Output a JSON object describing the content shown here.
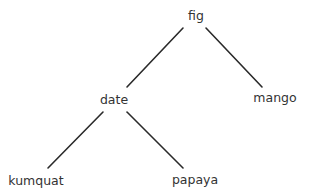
{
  "diagram": {
    "type": "tree",
    "nodes": {
      "root": {
        "label": "fig",
        "x": 196,
        "y": 16
      },
      "left": {
        "label": "date",
        "x": 114,
        "y": 100
      },
      "right": {
        "label": "mango",
        "x": 275,
        "y": 98
      },
      "left_left": {
        "label": "kumquat",
        "x": 36,
        "y": 181
      },
      "left_right": {
        "label": "papaya",
        "x": 195,
        "y": 180
      }
    },
    "edges": [
      {
        "from": "fig",
        "to": "date"
      },
      {
        "from": "fig",
        "to": "mango"
      },
      {
        "from": "date",
        "to": "kumquat"
      },
      {
        "from": "date",
        "to": "papaya"
      }
    ],
    "colors": {
      "edge": "#2a2a2a",
      "text": "#333333",
      "background": "#ffffff"
    }
  }
}
